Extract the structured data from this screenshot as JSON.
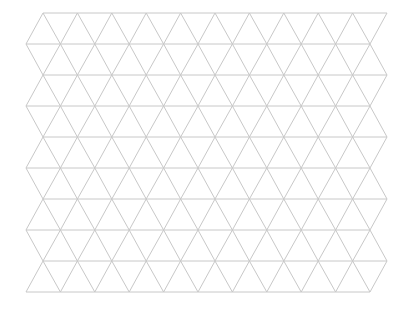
{
  "canvas": {
    "width": 412,
    "height": 317,
    "background": "#ffffff"
  },
  "grid": {
    "type": "triangular",
    "line_color": "#c8c8c8",
    "line_width": 1,
    "rows": 9,
    "segments_per_line": 10,
    "side": 34.4,
    "row_height": 31,
    "top_y": 13,
    "even_line_start_x": 43,
    "odd_line_start_x": 26
  }
}
